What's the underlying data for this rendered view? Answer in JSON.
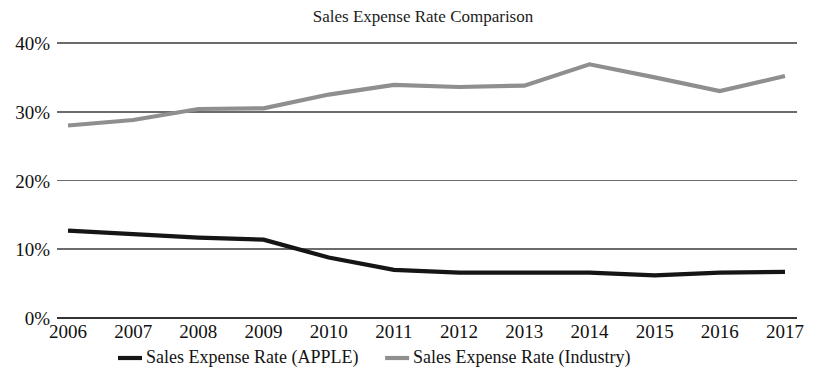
{
  "chart_data": {
    "type": "line",
    "title": "Sales Expense Rate Comparison",
    "xlabel": "",
    "ylabel": "",
    "grid": true,
    "legend_position": "bottom",
    "categories": [
      "2006",
      "2007",
      "2008",
      "2009",
      "2010",
      "2011",
      "2012",
      "2013",
      "2014",
      "2015",
      "2016",
      "2017"
    ],
    "x": [
      2006,
      2007,
      2008,
      2009,
      2010,
      2011,
      2012,
      2013,
      2014,
      2015,
      2016,
      2017
    ],
    "ylim": [
      0,
      40
    ],
    "yticks": [
      0,
      10,
      20,
      30,
      40
    ],
    "ytick_labels": [
      "0%",
      "10%",
      "20%",
      "30%",
      "40%"
    ],
    "series": [
      {
        "name": "Sales Expense Rate (APPLE)",
        "color": "#151515",
        "width": 4.2,
        "values": [
          12.7,
          12.2,
          11.7,
          11.4,
          8.8,
          7.0,
          6.6,
          6.6,
          6.6,
          6.2,
          6.6,
          6.7
        ]
      },
      {
        "name": "Sales Expense Rate (Industry)",
        "color": "#8f8f8f",
        "width": 4.2,
        "values": [
          28.0,
          28.8,
          30.4,
          30.5,
          32.5,
          33.9,
          33.6,
          33.8,
          36.9,
          35.0,
          33.0,
          35.2
        ]
      }
    ]
  },
  "legend": {
    "items": [
      {
        "label": "Sales Expense Rate (APPLE)",
        "color": "#151515"
      },
      {
        "label": "Sales Expense Rate (Industry)",
        "color": "#8f8f8f"
      }
    ]
  }
}
